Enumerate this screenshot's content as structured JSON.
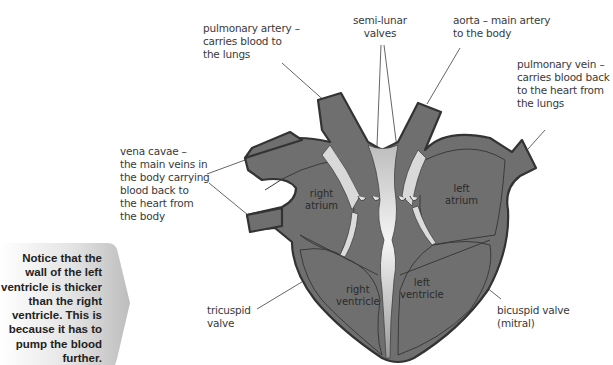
{
  "diagram": {
    "colors": {
      "heart_fill": "#6f6f6f",
      "heart_outline": "#333333",
      "septum_light": "#e8e8e8",
      "leader_line": "#555555",
      "label_text": "#3a3a3a",
      "callout_bg": "#c4c4c4"
    },
    "external_labels": {
      "pulmonary_artery": [
        "pulmonary artery –",
        "carries blood to",
        "the lungs"
      ],
      "semi_lunar_valves": [
        "semi-lunar",
        "valves"
      ],
      "aorta": [
        "aorta – main artery",
        "to the body"
      ],
      "pulmonary_vein": [
        "pulmonary vein –",
        "carries blood back",
        "to the heart from",
        "the lungs"
      ],
      "vena_cavae": [
        "vena cavae –",
        "the main veins in",
        "the body carrying",
        "blood back to",
        "the heart from",
        "the body"
      ],
      "tricuspid_valve": [
        "tricuspid",
        "valve"
      ],
      "bicuspid_valve": [
        "bicuspid valve",
        "(mitral)"
      ]
    },
    "chamber_labels": {
      "right_atrium": [
        "right",
        "atrium"
      ],
      "left_atrium": [
        "left",
        "atrium"
      ],
      "right_ventricle": [
        "right",
        "ventricle"
      ],
      "left_ventricle": [
        "left",
        "ventricle"
      ]
    },
    "callout": {
      "lines": [
        "Notice that the",
        "wall of the left",
        "ventricle is thicker",
        "than the right",
        "ventricle. This is",
        "because it has to",
        "pump the blood",
        "further."
      ]
    }
  }
}
